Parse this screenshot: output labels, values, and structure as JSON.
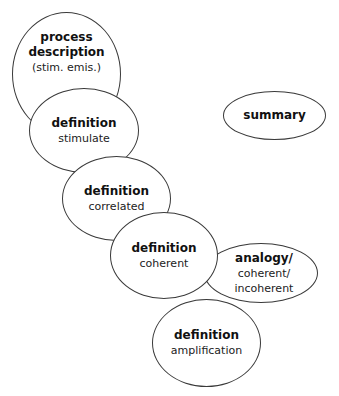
{
  "diagram": {
    "nodes": [
      {
        "id": "process",
        "title": "process description",
        "title_lines": [
          "process",
          "description"
        ],
        "subtitle": "(stim. emis.)"
      },
      {
        "id": "stimulate",
        "title": "definition",
        "subtitle": "stimulate"
      },
      {
        "id": "correlated",
        "title": "definition",
        "subtitle": "correlated"
      },
      {
        "id": "coherent",
        "title": "definition",
        "subtitle": "coherent"
      },
      {
        "id": "analogy",
        "title": "analogy/",
        "subtitle_lines": [
          "coherent/",
          "incoherent"
        ]
      },
      {
        "id": "amplification",
        "title": "definition",
        "subtitle": "amplification"
      },
      {
        "id": "summary",
        "title": "summary"
      }
    ],
    "colors": {
      "stroke": "#3a3a3a",
      "fill": "#ffffff",
      "text": "#111111"
    }
  }
}
